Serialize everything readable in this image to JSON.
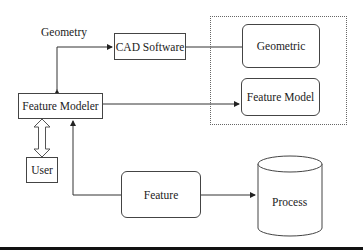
{
  "diagram": {
    "nodes": {
      "cad_software": "CAD Software",
      "feature_modeler": "Feature Modeler",
      "user": "User",
      "geometric": "Geometric",
      "feature_model": "Feature Model",
      "feature": "Feature",
      "process": "Process"
    },
    "edge_labels": {
      "geometry": "Geometry"
    },
    "edges": [
      {
        "from": "cad_software",
        "to": "feature_modeler",
        "label": "Geometry",
        "bidirectional": true
      },
      {
        "from": "cad_software",
        "to": "geometric"
      },
      {
        "from": "feature_modeler",
        "to": "feature_model"
      },
      {
        "from": "feature_modeler",
        "to": "user",
        "style": "hollow-double-arrow"
      },
      {
        "from": "feature",
        "to": "feature_modeler"
      },
      {
        "from": "feature",
        "to": "process"
      }
    ],
    "groups": [
      {
        "name": "model-group",
        "members": [
          "geometric",
          "feature_model"
        ],
        "style": "dotted"
      }
    ]
  }
}
